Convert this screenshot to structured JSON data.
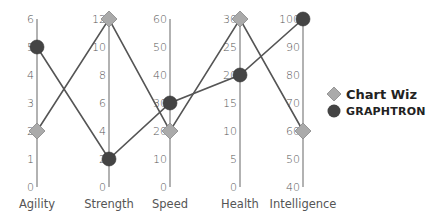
{
  "chart_data": {
    "type": "parallel-coordinates",
    "title": "",
    "axes": [
      {
        "name": "Agility",
        "min": 0,
        "max": 6,
        "ticks": [
          0,
          1,
          2,
          3,
          4,
          5,
          6
        ]
      },
      {
        "name": "Strength",
        "min": 0,
        "max": 12,
        "ticks": [
          0,
          2,
          4,
          6,
          8,
          10,
          12
        ]
      },
      {
        "name": "Speed",
        "min": 0,
        "max": 60,
        "ticks": [
          0,
          10,
          20,
          30,
          40,
          50,
          60
        ]
      },
      {
        "name": "Health",
        "min": 0,
        "max": 30,
        "ticks": [
          0,
          5,
          10,
          15,
          20,
          25,
          30
        ]
      },
      {
        "name": "Intelligence",
        "min": 40,
        "max": 100,
        "ticks": [
          40,
          50,
          60,
          70,
          80,
          90,
          100
        ]
      }
    ],
    "series": [
      {
        "name": "Chart Wiz",
        "marker": "diamond",
        "color": "#aaaaaa",
        "values": [
          2,
          12,
          20,
          30,
          60
        ]
      },
      {
        "name": "GRAPHTRON",
        "marker": "circle",
        "color": "#444444",
        "values": [
          5,
          2,
          30,
          20,
          100
        ]
      }
    ],
    "legend_position": "right",
    "grid": false
  },
  "colors": {
    "axis": "#999999",
    "line": "#555555",
    "diamond_fill": "#aaaaaa",
    "circle_fill": "#444444"
  }
}
